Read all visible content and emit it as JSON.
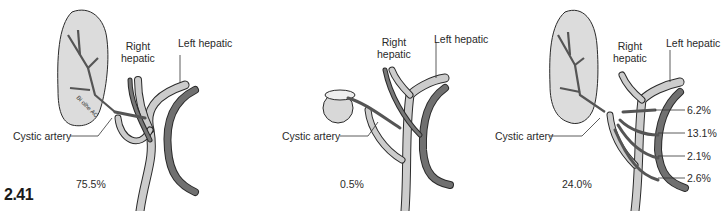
{
  "figure": {
    "number": "2.41",
    "colors": {
      "gallbladder_fill": "#d9d9d9",
      "artery_light": "#c8c8c8",
      "artery_dark": "#6e6e6e",
      "outline": "#2a2a2a"
    }
  },
  "panels": [
    {
      "id": "a",
      "labels": {
        "right_hepatic_line1": "Right",
        "right_hepatic_line2": "hepatic",
        "left_hepatic": "Left hepatic",
        "cystic_artery": "Cystic artery",
        "percentage": "75.5%",
        "artist_signature": "Bi olhe AC"
      }
    },
    {
      "id": "b",
      "labels": {
        "right_hepatic_line1": "Right",
        "right_hepatic_line2": "hepatic",
        "left_hepatic": "Left hepatic",
        "cystic_artery": "Cystic artery",
        "percentage": "0.5%"
      }
    },
    {
      "id": "c",
      "labels": {
        "right_hepatic_line1": "Right",
        "right_hepatic_line2": "hepatic",
        "left_hepatic": "Left hepatic",
        "cystic_artery": "Cystic artery",
        "percentage": "24.0%",
        "variants": [
          "6.2%",
          "13.1%",
          "2.1%",
          "2.6%"
        ]
      }
    }
  ]
}
